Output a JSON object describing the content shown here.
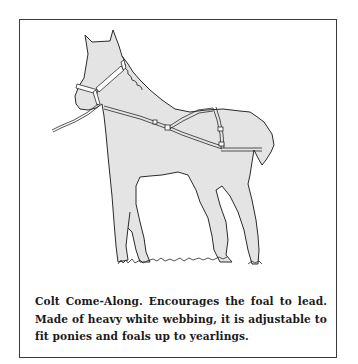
{
  "figure": {
    "icon": "foal-illustration",
    "colors": {
      "border": "#3a3a3a",
      "fill": "#e4e4e4",
      "outline": "#2a2a2a",
      "text": "#1a1a1a"
    }
  },
  "caption": {
    "lines": [
      "Colt Come-Along. Encourages the foal to lead.",
      "Made of heavy white webbing, it is adjustable to",
      "fit ponies and foals up to yearlings."
    ]
  }
}
